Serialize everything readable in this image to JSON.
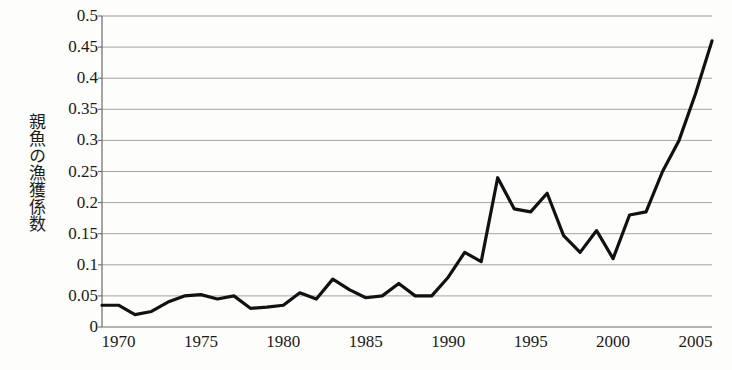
{
  "chart_data": {
    "type": "line",
    "title": "",
    "subtitle": "",
    "xlabel": "",
    "ylabel": "親魚の漁獲係数",
    "ylabel_reading": "oyazakana no gyokaku keisu",
    "xlim": [
      1969,
      2006
    ],
    "ylim": [
      0,
      0.5
    ],
    "y_tick_step": 0.05,
    "grid": "horizontal",
    "legend": "none",
    "markers": "none",
    "line_color": "#111111",
    "line_width": 3.2,
    "background_color": "#fdfdfb",
    "axis_color": "#6b6b6b",
    "gridline_color": "#9a9a9a",
    "x_tick_labels": [
      "1970",
      "1975",
      "1980",
      "1985",
      "1990",
      "1995",
      "2000",
      "2005"
    ],
    "x_tick_values": [
      1970,
      1975,
      1980,
      1985,
      1990,
      1995,
      2000,
      2005
    ],
    "y_tick_labels": [
      "0",
      "0.05",
      "0.1",
      "0.15",
      "0.2",
      "0.25",
      "0.3",
      "0.35",
      "0.4",
      "0.45",
      "0.5"
    ],
    "y_tick_values": [
      0,
      0.05,
      0.1,
      0.15,
      0.2,
      0.25,
      0.3,
      0.35,
      0.4,
      0.45,
      0.5
    ],
    "x": [
      1969,
      1970,
      1971,
      1972,
      1973,
      1974,
      1975,
      1976,
      1977,
      1978,
      1979,
      1980,
      1981,
      1982,
      1983,
      1984,
      1985,
      1986,
      1987,
      1988,
      1989,
      1990,
      1991,
      1992,
      1993,
      1994,
      1995,
      1996,
      1997,
      1998,
      1999,
      2000,
      2001,
      2002,
      2003,
      2004,
      2005,
      2006
    ],
    "values": [
      0.035,
      0.035,
      0.02,
      0.025,
      0.04,
      0.05,
      0.052,
      0.045,
      0.05,
      0.03,
      0.032,
      0.035,
      0.055,
      0.045,
      0.077,
      0.06,
      0.047,
      0.05,
      0.07,
      0.05,
      0.05,
      0.08,
      0.12,
      0.105,
      0.24,
      0.19,
      0.185,
      0.215,
      0.147,
      0.12,
      0.155,
      0.11,
      0.18,
      0.185,
      0.25,
      0.3,
      0.375,
      0.46
    ],
    "series": [
      {
        "name": "親魚の漁獲係数",
        "values": [
          0.035,
          0.035,
          0.02,
          0.025,
          0.04,
          0.05,
          0.052,
          0.045,
          0.05,
          0.03,
          0.032,
          0.035,
          0.055,
          0.045,
          0.077,
          0.06,
          0.047,
          0.05,
          0.07,
          0.05,
          0.05,
          0.08,
          0.12,
          0.105,
          0.24,
          0.19,
          0.185,
          0.215,
          0.147,
          0.12,
          0.155,
          0.11,
          0.18,
          0.185,
          0.25,
          0.3,
          0.375,
          0.46
        ]
      }
    ],
    "annotations": [],
    "plot_area": {
      "left": 102,
      "top": 16,
      "right": 712,
      "bottom": 327
    }
  }
}
